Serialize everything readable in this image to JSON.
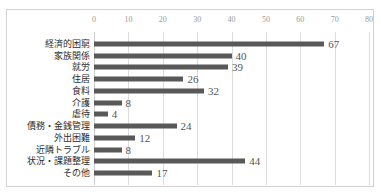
{
  "title": "",
  "chart_data": {
    "type": "bar",
    "orientation": "horizontal",
    "title": "",
    "xlabel": "",
    "ylabel": "",
    "xlim": [
      0,
      80
    ],
    "xticks": [
      0,
      10,
      20,
      30,
      40,
      50,
      60,
      70,
      80
    ],
    "grid": true,
    "legend": false,
    "bar_color": "#595959",
    "categories": [
      "経済的困窮",
      "家族関係",
      "就労",
      "住居",
      "食料",
      "介護",
      "虐待",
      "債務・金銭管理",
      "外出困難",
      "近隣トラブル",
      "状況・課題整理",
      "その他"
    ],
    "values": [
      67,
      40,
      39,
      26,
      32,
      8,
      4,
      24,
      12,
      8,
      44,
      17
    ]
  }
}
